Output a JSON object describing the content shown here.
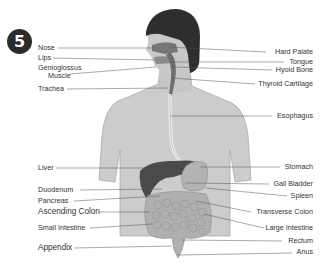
{
  "figure_number": "5",
  "left_labels": [
    {
      "text": "Nose",
      "x": 38,
      "y": 44
    },
    {
      "text": "Lips",
      "x": 38,
      "y": 54
    },
    {
      "text": "Genioglossus",
      "x": 38,
      "y": 64
    },
    {
      "text": "Muscle",
      "x": 48,
      "y": 73
    },
    {
      "text": "Trachea",
      "x": 38,
      "y": 85
    },
    {
      "text": "Liver",
      "x": 38,
      "y": 164
    },
    {
      "text": "Duodenum",
      "x": 38,
      "y": 186
    },
    {
      "text": "Pancreas",
      "x": 38,
      "y": 197
    },
    {
      "text": "Ascending Colon",
      "x": 38,
      "y": 208
    },
    {
      "text": "Small Intestine",
      "x": 38,
      "y": 224
    },
    {
      "text": "Appendix",
      "x": 38,
      "y": 244
    }
  ],
  "right_labels": [
    {
      "text": "Hard Palate",
      "y": 48
    },
    {
      "text": "Tongue",
      "y": 59
    },
    {
      "text": "Hyoid Bone",
      "y": 66
    },
    {
      "text": "Thyroid Cartilage",
      "y": 80
    },
    {
      "text": "Esophagus",
      "y": 113
    },
    {
      "text": "Stomach",
      "y": 164
    },
    {
      "text": "Gall Bladder",
      "y": 181
    },
    {
      "text": "Spleen",
      "y": 193
    },
    {
      "text": "Transverse Colon",
      "y": 208
    },
    {
      "text": "Large Intestine",
      "y": 225
    },
    {
      "text": "Rectum",
      "y": 237
    },
    {
      "text": "Anus",
      "y": 249
    }
  ],
  "colors": {
    "skin": "#c9c9c9",
    "hair": "#2e2e2e",
    "liver": "#4a4a4a",
    "organs": "#b5b5b5",
    "lines": "#555555",
    "badge": "#2b2b2b"
  }
}
